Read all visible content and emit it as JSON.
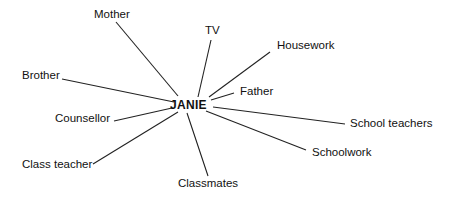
{
  "diagram": {
    "type": "radial-relationship-map",
    "center": {
      "label": "JANIE",
      "x": 170,
      "y": 99
    },
    "nodes": [
      {
        "id": "mother",
        "label": "Mother",
        "x": 94,
        "y": 9,
        "line": [
          116,
          22,
          178,
          96
        ]
      },
      {
        "id": "tv",
        "label": "TV",
        "x": 205,
        "y": 25,
        "line": [
          211,
          40,
          198,
          97
        ]
      },
      {
        "id": "housework",
        "label": "Housework",
        "x": 277,
        "y": 40,
        "line": [
          270,
          52,
          209,
          97
        ]
      },
      {
        "id": "father",
        "label": "Father",
        "x": 240,
        "y": 86,
        "line": [
          234,
          93,
          211,
          100
        ]
      },
      {
        "id": "brother",
        "label": "Brother",
        "x": 22,
        "y": 70,
        "line": [
          62,
          79,
          174,
          102
        ]
      },
      {
        "id": "counsellor",
        "label": "Counsellor",
        "x": 55,
        "y": 113,
        "line": [
          114,
          121,
          172,
          108
        ]
      },
      {
        "id": "class-teacher",
        "label": "Class teacher",
        "x": 22,
        "y": 159,
        "line": [
          93,
          164,
          178,
          112
        ]
      },
      {
        "id": "classmates",
        "label": "Classmates",
        "x": 178,
        "y": 178,
        "line": [
          208,
          176,
          187,
          113
        ]
      },
      {
        "id": "school-teachers",
        "label": "School teachers",
        "x": 350,
        "y": 118,
        "line": [
          345,
          124,
          213,
          107
        ]
      },
      {
        "id": "schoolwork",
        "label": "Schoolwork",
        "x": 312,
        "y": 147,
        "line": [
          306,
          150,
          206,
          111
        ]
      }
    ],
    "line_color": "#222222"
  }
}
